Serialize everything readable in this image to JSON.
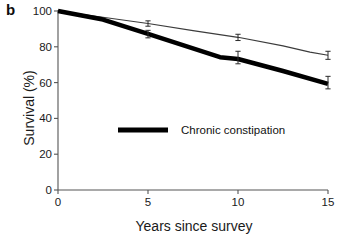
{
  "panel": {
    "label": "b"
  },
  "chart_data": {
    "type": "line",
    "title": "",
    "xlabel": "Years since survey",
    "ylabel": "Survival (%)",
    "xlim": [
      0,
      15
    ],
    "ylim": [
      0,
      100
    ],
    "xticks": [
      0,
      5,
      10,
      15
    ],
    "xtick_labels": [
      "0",
      "5",
      "10",
      "15"
    ],
    "yticks": [
      0,
      20,
      40,
      60,
      80,
      100
    ],
    "ytick_labels": [
      "0",
      "20",
      "40",
      "60",
      "80",
      "100"
    ],
    "grid": false,
    "legend_position": "center",
    "series": [
      {
        "name": "No chronic constipation",
        "style": "thin",
        "color": "#3c3c3c",
        "in_legend": false,
        "x": [
          0,
          2.5,
          5,
          7.5,
          10,
          12.5,
          14,
          15
        ],
        "y": [
          100,
          96.5,
          93,
          89,
          85.3,
          80.5,
          77,
          75.3
        ],
        "markers": [
          {
            "x": 5,
            "y": 93,
            "err_low": 91.5,
            "err_high": 94.5
          },
          {
            "x": 10,
            "y": 85.3,
            "err_low": 83.5,
            "err_high": 87
          },
          {
            "x": 15,
            "y": 75.3,
            "err_low": 73,
            "err_high": 77.5
          }
        ]
      },
      {
        "name": "Chronic constipation",
        "style": "thick",
        "color": "#000000",
        "in_legend": true,
        "x": [
          0,
          2.5,
          5,
          9,
          10,
          12.5,
          15
        ],
        "y": [
          100,
          95.2,
          87.2,
          74.2,
          73.2,
          66.5,
          59.3
        ],
        "markers": [
          {
            "x": 5,
            "y": 87.2,
            "err_low": 85,
            "err_high": 89.2
          },
          {
            "x": 10,
            "y": 73.2,
            "err_low": 70.5,
            "err_high": 77.5
          },
          {
            "x": 15,
            "y": 59.3,
            "err_low": 56.5,
            "err_high": 63.5
          }
        ]
      }
    ],
    "legend": [
      {
        "label": "Chronic constipation",
        "swatch_color": "#000000",
        "swatch_style": "thick-line"
      }
    ]
  }
}
